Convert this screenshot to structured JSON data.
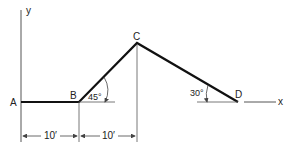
{
  "diagram": {
    "axes": {
      "x_label": "x",
      "y_label": "y"
    },
    "points": {
      "A": "A",
      "B": "B",
      "C": "C",
      "D": "D"
    },
    "angles": {
      "at_B": "45°",
      "at_D": "30°"
    },
    "dimensions": {
      "AB": "10′",
      "B_to_C": "10′"
    },
    "colors": {
      "member": "#111111",
      "thin_line": "#555555",
      "background": "#ffffff"
    }
  }
}
